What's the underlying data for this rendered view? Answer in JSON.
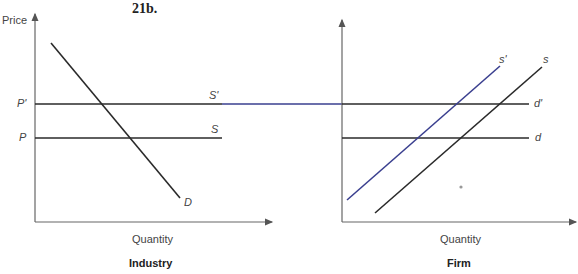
{
  "figure": {
    "title": "21b.",
    "colors": {
      "line": "#2a2a2a",
      "shifted_supply": "#3a3f8f",
      "axis": "#555555"
    }
  },
  "industry": {
    "panel_label": "Industry",
    "y_axis_label": "Price",
    "x_axis_label": "Quantity",
    "price_labels": {
      "p_prime": "P'",
      "p": "P"
    },
    "curve_labels": {
      "s_prime": "S'",
      "s": "S",
      "d": "D"
    }
  },
  "firm": {
    "panel_label": "Firm",
    "x_axis_label": "Quantity",
    "curve_labels": {
      "s_prime": "s'",
      "s": "s",
      "d_prime": "d'",
      "d": "d"
    }
  }
}
